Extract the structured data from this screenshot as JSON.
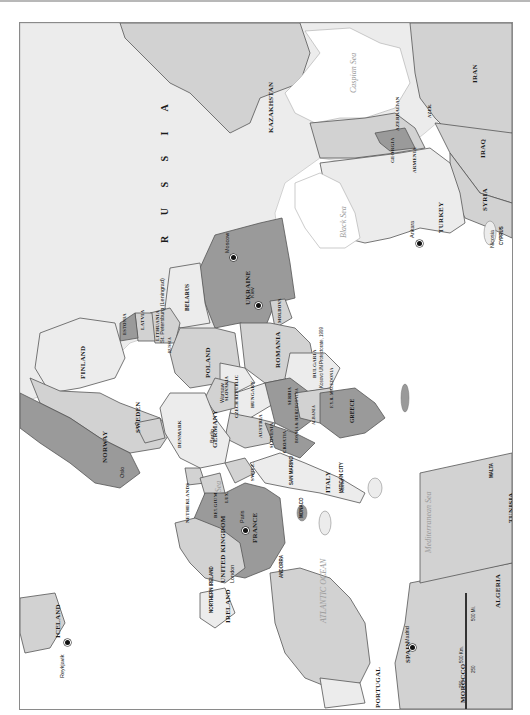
{
  "map": {
    "title": "Europe",
    "orientation": "rotated 90° (north to the left)",
    "colors": {
      "water": "#ffffff",
      "land_light": "#ececec",
      "land_mid": "#d2d2d2",
      "land_dark": "#9a9a9a",
      "border": "#555555"
    },
    "large_labels": {
      "russia": "R U S S I A"
    },
    "countries": [
      {
        "name": "KAZAKHSTAN"
      },
      {
        "name": "IRAN"
      },
      {
        "name": "IRAQ"
      },
      {
        "name": "SYRIA"
      },
      {
        "name": "TURKEY"
      },
      {
        "name": "CYPRUS"
      },
      {
        "name": "GEORGIA"
      },
      {
        "name": "ARMENIA"
      },
      {
        "name": "AZERBAIJAN"
      },
      {
        "name": "AZER."
      },
      {
        "name": "UKRAINE"
      },
      {
        "name": "MOLDOVA"
      },
      {
        "name": "BELARUS"
      },
      {
        "name": "LITHUANIA"
      },
      {
        "name": "LATVIA"
      },
      {
        "name": "ESTONIA"
      },
      {
        "name": "RUSSIA"
      },
      {
        "name": "FINLAND"
      },
      {
        "name": "SWEDEN"
      },
      {
        "name": "NORWAY"
      },
      {
        "name": "DENMARK"
      },
      {
        "name": "POLAND"
      },
      {
        "name": "GERMANY"
      },
      {
        "name": "NETHERLANDS"
      },
      {
        "name": "BELGIUM"
      },
      {
        "name": "LUX."
      },
      {
        "name": "FRANCE"
      },
      {
        "name": "SWITZ."
      },
      {
        "name": "AUSTRIA"
      },
      {
        "name": "CZECH REPUBLIC"
      },
      {
        "name": "SLOVAKIA"
      },
      {
        "name": "HUNGARY"
      },
      {
        "name": "ROMANIA"
      },
      {
        "name": "BULGARIA"
      },
      {
        "name": "SERBIA"
      },
      {
        "name": "SLOVENIA"
      },
      {
        "name": "CROATIA"
      },
      {
        "name": "BOSNIA & HERZEGOVINA"
      },
      {
        "name": "MONT."
      },
      {
        "name": "ALBANIA"
      },
      {
        "name": "F.Y.R. MACEDONIA"
      },
      {
        "name": "GREECE"
      },
      {
        "name": "ITALY"
      },
      {
        "name": "SAN MARINO"
      },
      {
        "name": "VATICAN CITY"
      },
      {
        "name": "MONACO"
      },
      {
        "name": "ANDORRA"
      },
      {
        "name": "SPAIN"
      },
      {
        "name": "PORTUGAL"
      },
      {
        "name": "MOROCCO"
      },
      {
        "name": "ALGERIA"
      },
      {
        "name": "TUNISIA"
      },
      {
        "name": "MALTA"
      },
      {
        "name": "UNITED KINGDOM"
      },
      {
        "name": "IRELAND"
      },
      {
        "name": "NORTHERN IRELAND"
      },
      {
        "name": "ICELAND"
      }
    ],
    "cities": [
      "Baku",
      "Tbilisi",
      "Yerevan",
      "Donetsk",
      "Kharkov",
      "Dnepropetrovsk",
      "Kiev",
      "Odessa",
      "Chisinau",
      "Bucharest",
      "Istanbul",
      "Ankara",
      "Nicosia",
      "Sofia",
      "Skopje",
      "Belgrade",
      "Podgorica",
      "Tirane",
      "Sarajevo",
      "Zagreb",
      "Ljubljana",
      "Budapest",
      "Bratislava",
      "Vienna",
      "Prague",
      "Warsaw",
      "Gdansk",
      "Berlin",
      "Hamburg",
      "Leipzig",
      "Frankfurt",
      "Stuttgart",
      "Munich",
      "Bonn",
      "Luxembourg",
      "Brussels",
      "Amsterdam",
      "The Hague",
      "Paris",
      "Lyons",
      "Geneva",
      "Bern",
      "Zurich",
      "Vaduz",
      "Milan",
      "Turin",
      "Monaco",
      "San Marino",
      "Rome",
      "Naples",
      "Valletta",
      "Barcelona",
      "Andorra la Vella",
      "Madrid",
      "Lisbon",
      "Porto",
      "London",
      "Glasgow",
      "Dublin",
      "Reykjavik",
      "Oslo",
      "Stockholm",
      "Copenhagen",
      "Helsinki",
      "Tallinn",
      "Riga",
      "Vilnius",
      "Minsk",
      "Moscow",
      "St. Petersburg (Leningrad)",
      "Athens"
    ],
    "water_bodies": [
      {
        "name": "Caspian Sea"
      },
      {
        "name": "Black Sea"
      },
      {
        "name": "Mediterranean Sea"
      },
      {
        "name": "North Sea"
      },
      {
        "name": "ATLANTIC OCEAN"
      }
    ],
    "islands": [
      {
        "name": "Faroe Islands",
        "note": "(Den.)"
      },
      {
        "name": "Shetland Islands",
        "note": "(U.K.)"
      },
      {
        "name": "Corsica",
        "note": "(Fr.)"
      },
      {
        "name": "Sardinia",
        "note": "(It.)"
      },
      {
        "name": "Sicily",
        "note": "(It.)"
      },
      {
        "name": "Balearic Islands",
        "note": "(Sp.)"
      },
      {
        "name": "Crete",
        "note": "(Gr.)"
      },
      {
        "name": "Gibraltar",
        "note": "(U.K.)"
      }
    ],
    "annotations": {
      "kosovo": "Kosovo UN Protectorate, 1999",
      "russia_kal": "RUSSIA"
    },
    "scale_bar": {
      "km_ticks": [
        "0",
        "250",
        "500 Km."
      ],
      "mi_ticks": [
        "0",
        "250",
        "500 Mi."
      ]
    }
  }
}
